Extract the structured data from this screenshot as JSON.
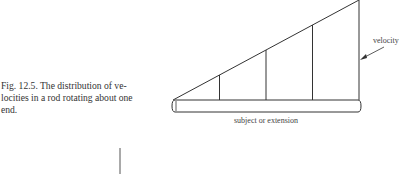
{
  "figure": {
    "caption_line1": "Fig. 12.5. The distribution of ve-",
    "caption_line2": "locities in a rod rotating about one",
    "caption_line3": "end.",
    "velocity_label": "velocity",
    "rod_label": "subject or extension",
    "velocity_profile": {
      "description": "linear increase from pivot end to free end",
      "marker_fractions": [
        0.25,
        0.5,
        0.75,
        1.0
      ]
    }
  }
}
